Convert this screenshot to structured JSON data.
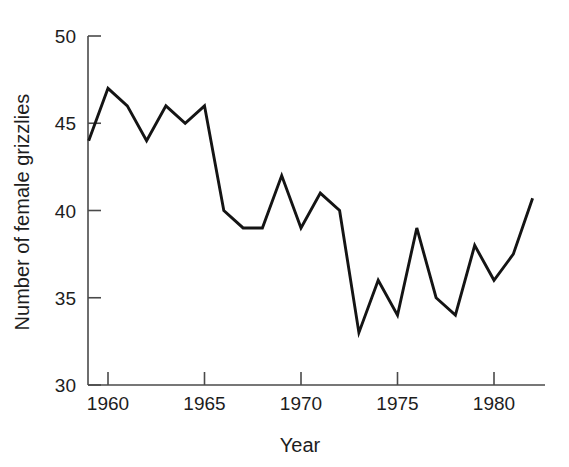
{
  "chart_data": {
    "type": "line",
    "title": "",
    "xlabel": "Year",
    "ylabel": "Number of female grizzlies",
    "xlim": [
      1959,
      1982
    ],
    "ylim": [
      30,
      50
    ],
    "xticks": [
      1960,
      1965,
      1970,
      1975,
      1980
    ],
    "xtick_labels": [
      "1960",
      "1965",
      "1970",
      "1975",
      "1980"
    ],
    "yticks": [
      30,
      35,
      40,
      45,
      50
    ],
    "ytick_labels": [
      "30",
      "35",
      "40",
      "45",
      "50"
    ],
    "grid": false,
    "legend": false,
    "line_color": "#141414",
    "axis_color": "#4a4a4a",
    "background_color": "#ffffff",
    "x": [
      1959,
      1960,
      1961,
      1962,
      1963,
      1964,
      1965,
      1966,
      1967,
      1968,
      1969,
      1970,
      1971,
      1972,
      1973,
      1974,
      1975,
      1976,
      1977,
      1978,
      1979,
      1980,
      1981,
      1982
    ],
    "values": [
      44,
      47,
      46,
      44,
      46,
      45,
      46,
      40,
      39,
      39,
      42,
      39,
      41,
      40,
      33,
      36,
      34,
      39,
      35,
      34,
      38,
      36,
      37.5,
      40.7
    ],
    "series": [
      {
        "name": "Number of female grizzlies",
        "values": [
          44,
          47,
          46,
          44,
          46,
          45,
          46,
          40,
          39,
          39,
          42,
          39,
          41,
          40,
          33,
          36,
          34,
          39,
          35,
          34,
          38,
          36,
          37.5,
          40.7
        ]
      }
    ]
  }
}
